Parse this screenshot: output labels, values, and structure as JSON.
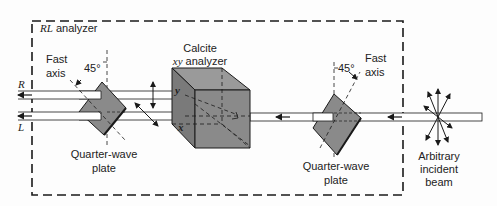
{
  "figure": {
    "box_label_italic": "RL",
    "box_label_rest": " analyzer",
    "beam_labels": {
      "right_circular": "R",
      "left_circular": "L"
    },
    "left_plate": {
      "fast_axis_line1": "Fast",
      "fast_axis_line2": "axis",
      "angle": "45°",
      "caption_line1": "Quarter-wave",
      "caption_line2": "plate"
    },
    "calcite": {
      "title_line1": "Calcite",
      "title_italic": "xy",
      "title_rest": " analyzer",
      "axis_y": "y",
      "axis_x": "x"
    },
    "right_plate": {
      "angle": "45°",
      "fast_axis_line1": "Fast",
      "fast_axis_line2": "axis",
      "caption_line1": "Quarter-wave",
      "caption_line2": "plate"
    },
    "source": {
      "line1": "Arbitrary",
      "line2": "incident",
      "line3": "beam"
    },
    "colors": {
      "component_fill": "#8a8a8a",
      "component_dark": "#6e6e6e",
      "line": "#1a1a1a",
      "beam_fill": "#ffffff"
    }
  }
}
